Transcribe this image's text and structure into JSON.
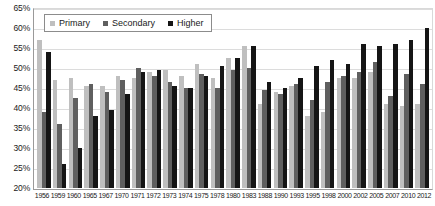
{
  "chart_data": {
    "type": "bar",
    "title": "",
    "subtitle": "",
    "xlabel": "",
    "ylabel": "",
    "ylim": [
      20,
      65
    ],
    "ytick_labels": [
      "65%",
      "60%",
      "55%",
      "50%",
      "45%",
      "40%",
      "35%",
      "30%",
      "25%",
      "20%"
    ],
    "ytick_values": [
      65,
      60,
      55,
      50,
      45,
      40,
      35,
      30,
      25,
      20
    ],
    "grid": true,
    "legend_position": "top-left",
    "legend": [
      "Primary",
      "Secondary",
      "Higher"
    ],
    "categories": [
      "1956",
      "1959",
      "1960",
      "1965",
      "1967",
      "1970",
      "1971",
      "1972",
      "1973",
      "1974",
      "1975",
      "1978",
      "1980",
      "1983",
      "1988",
      "1990",
      "1993",
      "1995",
      "1998",
      "2000",
      "2002",
      "2005",
      "2007",
      "2010",
      "2012"
    ],
    "series": [
      {
        "name": "Primary",
        "color": "#bfbfbf",
        "values": [
          57,
          47,
          47.5,
          45.5,
          45.5,
          48,
          47.5,
          49,
          49.5,
          48,
          51,
          47.5,
          52.5,
          55.5,
          41,
          44,
          45.5,
          38,
          39,
          47.5,
          47.5,
          49,
          41,
          40.5,
          41
        ]
      },
      {
        "name": "Secondary",
        "color": "#5f5f5f",
        "values": [
          39,
          36,
          42.5,
          46,
          44,
          47,
          50,
          48,
          46.5,
          45,
          48.5,
          45,
          49.5,
          50,
          44.5,
          43.5,
          46,
          42,
          46.5,
          48,
          49,
          51.5,
          43,
          48.5,
          46
        ]
      },
      {
        "name": "Higher",
        "color": "#151515",
        "values": [
          54,
          26,
          30,
          38,
          39.5,
          43.5,
          49,
          49.5,
          45.5,
          45,
          48,
          50.5,
          52.5,
          55.5,
          46.5,
          45,
          47.5,
          50.5,
          52,
          51,
          56,
          55.5,
          56,
          57,
          60
        ]
      }
    ]
  },
  "legend": {
    "items": [
      {
        "label": "Primary",
        "color": "#bfbfbf",
        "icon": "square-swatch-icon"
      },
      {
        "label": "Secondary",
        "color": "#5f5f5f",
        "icon": "square-swatch-icon"
      },
      {
        "label": "Higher",
        "color": "#151515",
        "icon": "square-swatch-icon"
      }
    ]
  }
}
